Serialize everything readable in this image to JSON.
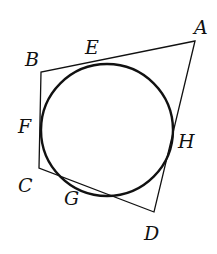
{
  "diagram": {
    "type": "quadrilateral-with-inscribed-circle",
    "vertices": {
      "A": {
        "label": "A",
        "x": 195,
        "y": 41
      },
      "B": {
        "label": "B",
        "x": 41,
        "y": 72
      },
      "C": {
        "label": "C",
        "x": 39,
        "y": 168
      },
      "D": {
        "label": "D",
        "x": 154,
        "y": 212
      }
    },
    "tangent_points": {
      "E": {
        "label": "E",
        "side": "AB"
      },
      "F": {
        "label": "F",
        "side": "BC"
      },
      "G": {
        "label": "G",
        "side": "CD"
      },
      "H": {
        "label": "H",
        "side": "DA"
      }
    },
    "circle": {
      "cx": 107,
      "cy": 130,
      "r": 66
    },
    "colors": {
      "stroke": "#111111",
      "background": "#ffffff"
    }
  }
}
